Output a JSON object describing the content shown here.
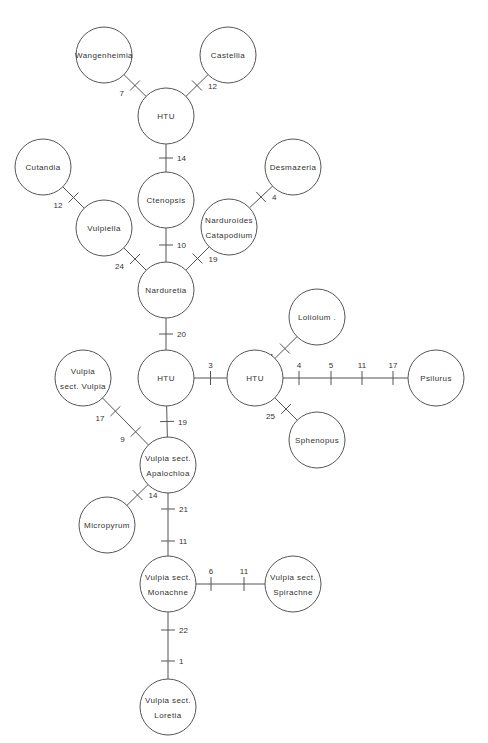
{
  "diagram": {
    "type": "phylogenetic-network",
    "node_radius": 28,
    "colors": {
      "stroke": "#555555",
      "text": "#333333",
      "background": "#ffffff"
    },
    "nodes": [
      {
        "id": "wangenheimia",
        "lines": [
          "Wangenheimia"
        ],
        "x": 104,
        "y": 55
      },
      {
        "id": "castellia",
        "lines": [
          "Castellia"
        ],
        "x": 228,
        "y": 55
      },
      {
        "id": "htu-top",
        "lines": [
          "HTU"
        ],
        "x": 166,
        "y": 116
      },
      {
        "id": "cutandia",
        "lines": [
          "Cutandia"
        ],
        "x": 43,
        "y": 167
      },
      {
        "id": "desmazeria",
        "lines": [
          "Desmazeria"
        ],
        "x": 293,
        "y": 167
      },
      {
        "id": "ctenopsis",
        "lines": [
          "Ctenopsis"
        ],
        "x": 166,
        "y": 200
      },
      {
        "id": "vulpiella",
        "lines": [
          "Vulpiella"
        ],
        "x": 104,
        "y": 228
      },
      {
        "id": "narduroides-catapodium",
        "lines": [
          "Narduroides",
          "Catapodium"
        ],
        "x": 229,
        "y": 227
      },
      {
        "id": "narduretia",
        "lines": [
          "Narduretia"
        ],
        "x": 166,
        "y": 290
      },
      {
        "id": "loliolum",
        "lines": [
          "Loliolum ."
        ],
        "x": 317,
        "y": 317
      },
      {
        "id": "vulpia-sect-vulpia",
        "lines": [
          "Vulpia",
          "sect. Vulpia"
        ],
        "x": 83,
        "y": 378
      },
      {
        "id": "htu-middle",
        "lines": [
          "HTU"
        ],
        "x": 166,
        "y": 378
      },
      {
        "id": "htu-right",
        "lines": [
          "HTU"
        ],
        "x": 255,
        "y": 378
      },
      {
        "id": "psilurus",
        "lines": [
          "Psilurus"
        ],
        "x": 436,
        "y": 378
      },
      {
        "id": "sphenopus",
        "lines": [
          "Sphenopus"
        ],
        "x": 317,
        "y": 440
      },
      {
        "id": "vulpia-sect-apalochloa",
        "lines": [
          "Vulpia sect.",
          "Apalochloa"
        ],
        "x": 168,
        "y": 465
      },
      {
        "id": "micropyrum",
        "lines": [
          "Micropyrum"
        ],
        "x": 107,
        "y": 525
      },
      {
        "id": "vulpia-sect-monachne",
        "lines": [
          "Vulpia sect.",
          "Monachne"
        ],
        "x": 168,
        "y": 584
      },
      {
        "id": "vulpia-sect-spirachne",
        "lines": [
          "Vulpia sect.",
          "Spirachne"
        ],
        "x": 293,
        "y": 584
      },
      {
        "id": "vulpia-sect-loretia",
        "lines": [
          "Vulpia sect.",
          "Loretia"
        ],
        "x": 168,
        "y": 707
      }
    ],
    "edges": [
      {
        "from": "wangenheimia",
        "to": "htu-top",
        "ticks": [
          {
            "t": 0.5,
            "label": "7",
            "side": "left"
          }
        ]
      },
      {
        "from": "castellia",
        "to": "htu-top",
        "ticks": [
          {
            "t": 0.5,
            "label": "12",
            "side": "right"
          }
        ]
      },
      {
        "from": "htu-top",
        "to": "ctenopsis",
        "ticks": [
          {
            "t": 0.5,
            "label": "14",
            "side": "right"
          }
        ]
      },
      {
        "from": "cutandia",
        "to": "vulpiella",
        "ticks": [
          {
            "t": 0.5,
            "label": "12",
            "side": "left"
          }
        ]
      },
      {
        "from": "desmazeria",
        "to": "narduroides-catapodium",
        "ticks": [
          {
            "t": 0.5,
            "label": "4",
            "side": "right"
          }
        ]
      },
      {
        "from": "ctenopsis",
        "to": "narduretia",
        "ticks": [
          {
            "t": 0.5,
            "label": "10",
            "side": "right"
          }
        ]
      },
      {
        "from": "vulpiella",
        "to": "narduretia",
        "ticks": [
          {
            "t": 0.5,
            "label": "24",
            "side": "left"
          }
        ]
      },
      {
        "from": "narduroides-catapodium",
        "to": "narduretia",
        "ticks": [
          {
            "t": 0.5,
            "label": "19",
            "side": "right"
          }
        ]
      },
      {
        "from": "narduretia",
        "to": "htu-middle",
        "ticks": [
          {
            "t": 0.5,
            "label": "20",
            "side": "right"
          }
        ]
      },
      {
        "from": "htu-middle",
        "to": "htu-right",
        "ticks": [
          {
            "t": 0.5,
            "label": "3",
            "side": "top"
          }
        ]
      },
      {
        "from": "htu-right",
        "to": "loliolum",
        "ticks": [
          {
            "t": 0.45,
            "label": "11",
            "side": "left"
          }
        ]
      },
      {
        "from": "htu-right",
        "to": "sphenopus",
        "ticks": [
          {
            "t": 0.5,
            "label": "25",
            "side": "left"
          }
        ]
      },
      {
        "from": "htu-right",
        "to": "psilurus",
        "ticks": [
          {
            "x": 299,
            "label": "4",
            "side": "top"
          },
          {
            "x": 331,
            "label": "5",
            "side": "top"
          },
          {
            "x": 362,
            "label": "11",
            "side": "top"
          },
          {
            "x": 393,
            "label": "17",
            "side": "top"
          }
        ]
      },
      {
        "from": "htu-middle",
        "to": "vulpia-sect-apalochloa",
        "ticks": [
          {
            "t": 0.5,
            "label": "19",
            "side": "right"
          }
        ]
      },
      {
        "from": "vulpia-sect-vulpia",
        "to": "vulpia-sect-apalochloa",
        "ticks": [
          {
            "t": 0.28,
            "label": "17",
            "side": "left"
          },
          {
            "t": 0.72,
            "label": "9",
            "side": "left"
          }
        ]
      },
      {
        "from": "vulpia-sect-apalochloa",
        "to": "micropyrum",
        "ticks": [
          {
            "t": 0.5,
            "label": "14",
            "side": "right"
          }
        ]
      },
      {
        "from": "vulpia-sect-apalochloa",
        "to": "vulpia-sect-monachne",
        "ticks": [
          {
            "y": 509,
            "label": "21",
            "side": "right"
          },
          {
            "y": 541,
            "label": "11",
            "side": "right"
          }
        ]
      },
      {
        "from": "vulpia-sect-monachne",
        "to": "vulpia-sect-spirachne",
        "ticks": [
          {
            "x": 211,
            "label": "6",
            "side": "top"
          },
          {
            "x": 244,
            "label": "11",
            "side": "top"
          }
        ]
      },
      {
        "from": "vulpia-sect-monachne",
        "to": "vulpia-sect-loretia",
        "ticks": [
          {
            "y": 630,
            "label": "22",
            "side": "right"
          },
          {
            "y": 661,
            "label": "1",
            "side": "right"
          }
        ]
      }
    ]
  }
}
